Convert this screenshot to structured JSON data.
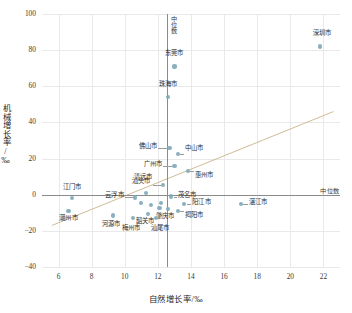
{
  "chart_data": {
    "type": "scatter",
    "title": "",
    "xlabel": "自然增长率/‰",
    "ylabel": "机械增长率/‰",
    "xlim": [
      5.0,
      23.0
    ],
    "ylim": [
      -40,
      100
    ],
    "xticks": [
      6,
      8,
      10,
      12,
      14,
      16,
      18,
      20,
      22
    ],
    "yticks": [
      -40,
      -20,
      0,
      20,
      40,
      60,
      80,
      100
    ],
    "grid": true,
    "legend": "none",
    "series": [
      {
        "name": "广东省各地级市",
        "marker_color": "#7fa9b8",
        "points": [
          {
            "label": "深圳市",
            "x": 21.8,
            "y": 82.0,
            "lx": 2,
            "ly": -13,
            "anchor": "center"
          },
          {
            "label": "东莞市",
            "x": 13.0,
            "y": 71.0,
            "lx": 0,
            "ly": -13,
            "anchor": "center"
          },
          {
            "label": "珠海市",
            "x": 12.6,
            "y": 54.0,
            "lx": 0,
            "ly": -13,
            "anchor": "center"
          },
          {
            "label": "佛山市",
            "x": 12.7,
            "y": 26.0,
            "lx": -12,
            "ly": -1,
            "anchor": "right"
          },
          {
            "label": "中山市",
            "x": 13.2,
            "y": 22.5,
            "lx": 7,
            "ly": -6,
            "anchor": "left"
          },
          {
            "label": "广州市",
            "x": 13.0,
            "y": 16.0,
            "lx": -12,
            "ly": -1,
            "anchor": "right"
          },
          {
            "label": "惠州市",
            "x": 13.8,
            "y": 13.0,
            "lx": 7,
            "ly": 4,
            "anchor": "left"
          },
          {
            "label": "清远市",
            "x": 12.3,
            "y": 5.5,
            "lx": -11,
            "ly": -7,
            "anchor": "right"
          },
          {
            "label": "汕头市",
            "x": 11.3,
            "y": 1.0,
            "lx": -5,
            "ly": -11,
            "anchor": "center"
          },
          {
            "label": "江门市",
            "x": 6.8,
            "y": -2.0,
            "lx": 0,
            "ly": -11,
            "anchor": "center"
          },
          {
            "label": "云浮市",
            "x": 10.6,
            "y": -1.5,
            "lx": -11,
            "ly": -2,
            "anchor": "right"
          },
          {
            "label": "茂名市",
            "x": 12.8,
            "y": -1.0,
            "lx": 7,
            "ly": -1,
            "anchor": "left"
          },
          {
            "label": "阳江市",
            "x": 13.6,
            "y": -5.0,
            "lx": 8,
            "ly": -1,
            "anchor": "left"
          },
          {
            "label": "湛江市",
            "x": 17.0,
            "y": -5.0,
            "lx": 8,
            "ly": -1,
            "anchor": "left"
          },
          {
            "label": "揭阳市",
            "x": 13.2,
            "y": -9.0,
            "lx": 7,
            "ly": 5,
            "anchor": "left"
          },
          {
            "label": "肇庆市",
            "x": 12.6,
            "y": -8.0,
            "lx": -3,
            "ly": 7,
            "anchor": "center"
          },
          {
            "label": "韶关市",
            "x": 11.4,
            "y": -10.5,
            "lx": -3,
            "ly": 8,
            "anchor": "center"
          },
          {
            "label": "潮州市",
            "x": 6.6,
            "y": -9.0,
            "lx": 0,
            "ly": 8,
            "anchor": "center"
          },
          {
            "label": "河源市",
            "x": 9.3,
            "y": -11.5,
            "lx": -2,
            "ly": 9,
            "anchor": "center"
          },
          {
            "label": "梅州市",
            "x": 10.5,
            "y": -13.0,
            "lx": -2,
            "ly": 10,
            "anchor": "center"
          },
          {
            "label": "汕尾市",
            "x": 11.9,
            "y": -13.0,
            "lx": 4,
            "ly": 10,
            "anchor": "center"
          },
          {
            "label": "",
            "x": 11.0,
            "y": -4.5,
            "lx": 0,
            "ly": 0,
            "anchor": "center"
          },
          {
            "label": "",
            "x": 11.6,
            "y": -5.5,
            "lx": 0,
            "ly": 0,
            "anchor": "center"
          },
          {
            "label": "",
            "x": 12.2,
            "y": -4.5,
            "lx": 0,
            "ly": 0,
            "anchor": "center"
          },
          {
            "label": "",
            "x": 12.1,
            "y": -7.5,
            "lx": 0,
            "ly": 0,
            "anchor": "center"
          }
        ]
      }
    ],
    "reference_lines": {
      "median_label": "中位数",
      "vertical_median_x": 12.55,
      "horizontal_median_y": 0.0
    },
    "trend_line": {
      "color": "#c9b38a",
      "x0": 5.6,
      "y0": -17.0,
      "x1": 22.6,
      "y1": 46.0
    }
  }
}
